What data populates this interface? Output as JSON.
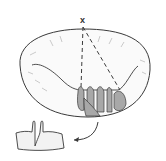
{
  "figure": {
    "apex_label": "x",
    "colors": {
      "outline": "#3a3a3a",
      "shading": "#bdbdbd",
      "leaflet_fill": "#a8a8a8",
      "background": "#ffffff"
    },
    "elements": [
      {
        "name": "valve-annulus-ring",
        "shape": "ellipse"
      },
      {
        "name": "dashed-line-vertical",
        "style": "dashed"
      },
      {
        "name": "dashed-line-diagonal",
        "style": "dashed"
      },
      {
        "name": "leaflet-scallops",
        "count": 5
      },
      {
        "name": "resected-segment",
        "shape": "excised leaflet piece"
      },
      {
        "name": "curved-arrow",
        "direction": "down-left"
      }
    ]
  }
}
